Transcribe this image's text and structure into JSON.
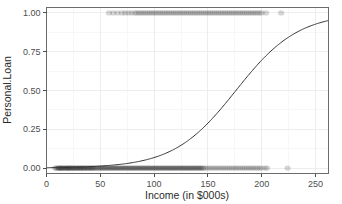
{
  "chart_data": {
    "type": "scatter",
    "title": "",
    "xlabel": "Income (in $000s)",
    "ylabel": "Personal.Loan",
    "xlim": [
      0,
      262
    ],
    "ylim": [
      -0.035,
      1.035
    ],
    "grid": true,
    "legend": null,
    "x_ticks": [
      0,
      50,
      100,
      150,
      200,
      250
    ],
    "x_tick_labels": [
      "0",
      "50",
      "100",
      "150",
      "200",
      "250"
    ],
    "x_minor_ticks": [
      25,
      75,
      125,
      175,
      225
    ],
    "y_ticks": [
      0.0,
      0.25,
      0.5,
      0.75,
      1.0
    ],
    "y_tick_labels": [
      "0.00",
      "0.25",
      "0.50",
      "0.75",
      "1.00"
    ],
    "y_minor_ticks": [
      0.125,
      0.375,
      0.625,
      0.875
    ],
    "series": [
      {
        "name": "Observations (Personal.Loan = 0)",
        "type": "scatter",
        "y_value": 0.0,
        "point_color": "#1a1a1a",
        "point_alpha": 0.18,
        "x": [
          8,
          9,
          10,
          11,
          11.5,
          12,
          13,
          13.5,
          14,
          15,
          15.5,
          16,
          17,
          18,
          18.5,
          19,
          20,
          20.5,
          21,
          22,
          22.5,
          23,
          24,
          25,
          25.5,
          26,
          27,
          28,
          28.5,
          29,
          30,
          31,
          31.5,
          32,
          33,
          34,
          34.5,
          35,
          36,
          37,
          38,
          38.5,
          39,
          40,
          41,
          42,
          42.5,
          43,
          44,
          45,
          46,
          47,
          48,
          49,
          50,
          51,
          52,
          53,
          54,
          55,
          56,
          57,
          58,
          59,
          60,
          61,
          62,
          63,
          64,
          65,
          66,
          67,
          68,
          69,
          70,
          71,
          72,
          73,
          74,
          75,
          76,
          77,
          78,
          79,
          80,
          81,
          82,
          83,
          84,
          85,
          86,
          87,
          88,
          89,
          90,
          91,
          92,
          93,
          94,
          95,
          96,
          97,
          98,
          99,
          100,
          101,
          102,
          103,
          104,
          105,
          106,
          107,
          108,
          109,
          110,
          111,
          112,
          113,
          114,
          115,
          116,
          117,
          118,
          119,
          120,
          121,
          122,
          123,
          124,
          125,
          126,
          127,
          128,
          129,
          130,
          131,
          132,
          133,
          134,
          135,
          136,
          137,
          138,
          139,
          140,
          141,
          142,
          143,
          144,
          145,
          146,
          148,
          150,
          152,
          154,
          156,
          158,
          160,
          162,
          164,
          166,
          168,
          170,
          172,
          174,
          176,
          178,
          180,
          182,
          184,
          186,
          188,
          190,
          192,
          194,
          196,
          198,
          200,
          203,
          205,
          224
        ]
      },
      {
        "name": "Observations (Personal.Loan = 1)",
        "type": "scatter",
        "y_value": 1.0,
        "point_color": "#1a1a1a",
        "point_alpha": 0.18,
        "x": [
          58,
          62,
          66,
          70,
          73,
          76,
          79,
          82,
          84,
          86,
          88,
          90,
          92,
          94,
          96,
          98,
          100,
          102,
          104,
          106,
          108,
          110,
          112,
          114,
          116,
          118,
          120,
          122,
          124,
          126,
          128,
          130,
          132,
          134,
          136,
          138,
          140,
          142,
          144,
          146,
          148,
          150,
          152,
          154,
          156,
          158,
          160,
          162,
          164,
          166,
          168,
          170,
          172,
          174,
          176,
          178,
          180,
          182,
          184,
          186,
          188,
          190,
          192,
          194,
          196,
          198,
          200,
          204,
          218
        ]
      },
      {
        "name": "Logistic fit",
        "type": "line",
        "line_color": "#333333",
        "line_width": 1,
        "model": "logistic",
        "midpoint_x": 176,
        "slope_k": 0.0345,
        "x_start": 0,
        "x_end": 262,
        "annotations": [
          {
            "x": 0,
            "y": 0.002
          },
          {
            "x": 50,
            "y": 0.012
          },
          {
            "x": 100,
            "y": 0.065
          },
          {
            "x": 125,
            "y": 0.14
          },
          {
            "x": 150,
            "y": 0.3
          },
          {
            "x": 176,
            "y": 0.5
          },
          {
            "x": 200,
            "y": 0.7
          },
          {
            "x": 225,
            "y": 0.84
          },
          {
            "x": 250,
            "y": 0.93
          },
          {
            "x": 262,
            "y": 0.96
          }
        ]
      }
    ],
    "style": {
      "panel_background": "#ffffff",
      "panel_border_color": "#606060",
      "major_grid_color": "#eeeeee",
      "minor_grid_color": "#f6f6f6",
      "tick_mark_color": "#4d4d4d",
      "text_color": "#2b2b2b"
    }
  }
}
